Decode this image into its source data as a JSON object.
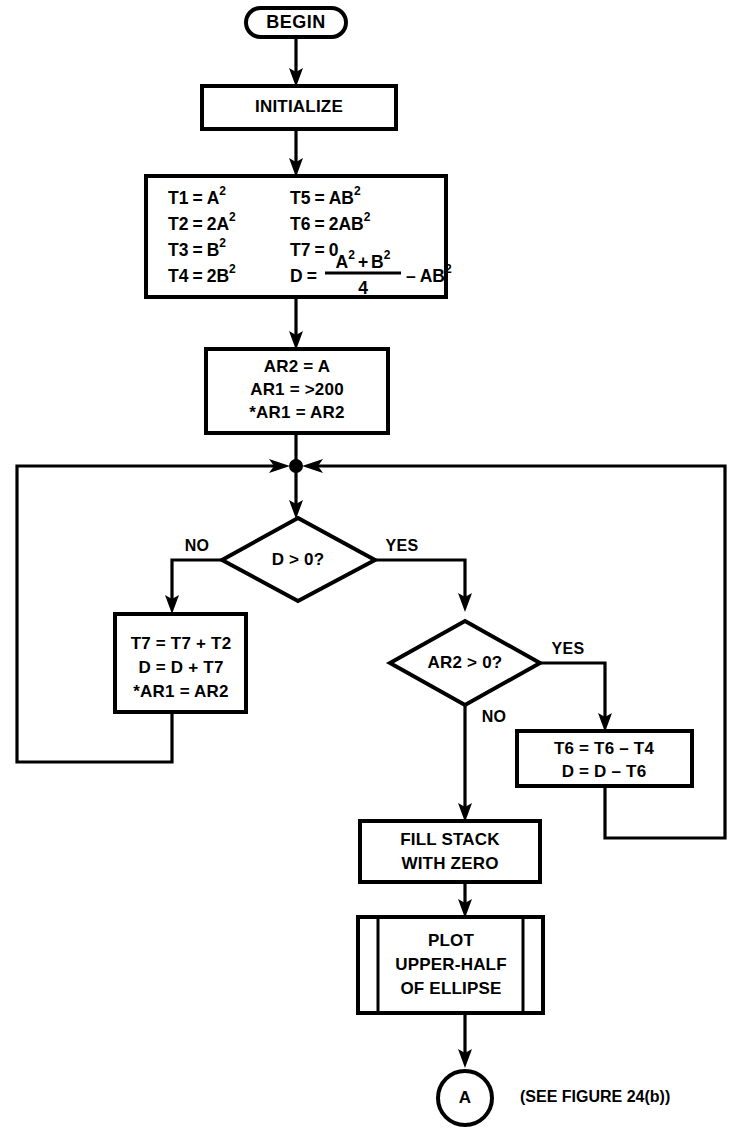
{
  "figure": {
    "note": "(SEE FIGURE 24(b))",
    "colors": {
      "background": "#ffffff",
      "stroke": "#000000",
      "fill": "#ffffff"
    }
  },
  "nodes": {
    "begin": {
      "shape": "terminator",
      "label": "BEGIN"
    },
    "initialize": {
      "shape": "process",
      "label": "INITIALIZE"
    },
    "assignments": {
      "shape": "process",
      "left_column": [
        {
          "lhs": "T1",
          "op": "=",
          "rhs": "A",
          "sup": "2"
        },
        {
          "lhs": "T2",
          "op": "=",
          "rhs": "2A",
          "sup": "2"
        },
        {
          "lhs": "T3",
          "op": "=",
          "rhs": "B",
          "sup": "2"
        },
        {
          "lhs": "T4",
          "op": "=",
          "rhs": "2B",
          "sup": "2"
        }
      ],
      "right_column": [
        {
          "lhs": "T5",
          "op": "=",
          "rhs": "AB",
          "sup": "2"
        },
        {
          "lhs": "T6",
          "op": "=",
          "rhs": "2AB",
          "sup": "2"
        },
        {
          "lhs": "T7",
          "op": "=",
          "rhs": "0",
          "sup": ""
        }
      ],
      "fraction_formula": {
        "lhs": "D",
        "op": "=",
        "numerator_a": "A",
        "numerator_a_sup": "2",
        "numerator_plus": "+",
        "numerator_b": "B",
        "numerator_b_sup": "2",
        "denominator": "4",
        "minus": "–",
        "tail": "AB",
        "tail_sup": "2"
      }
    },
    "ar_setup": {
      "shape": "process",
      "lines": [
        "AR2 = A",
        "AR1 = >200",
        "*AR1 = AR2"
      ]
    },
    "decision_d": {
      "shape": "decision",
      "label": "D > 0?",
      "yes_label": "YES",
      "no_label": "NO"
    },
    "update_t7": {
      "shape": "process",
      "lines": [
        "T7 = T7 + T2",
        "D = D + T7",
        "*AR1 = AR2"
      ]
    },
    "decision_ar2": {
      "shape": "decision",
      "label": "AR2 > 0?",
      "yes_label": "YES",
      "no_label": "NO"
    },
    "update_t6": {
      "shape": "process",
      "lines": [
        "T6 = T6 – T4",
        "D = D – T6"
      ]
    },
    "fill_stack": {
      "shape": "process",
      "lines": [
        "FILL STACK",
        "WITH ZERO"
      ]
    },
    "plot": {
      "shape": "predefined-process",
      "lines": [
        "PLOT",
        "UPPER-HALF",
        "OF ELLIPSE"
      ]
    },
    "connector_a": {
      "shape": "connector-circle",
      "label": "A"
    }
  }
}
